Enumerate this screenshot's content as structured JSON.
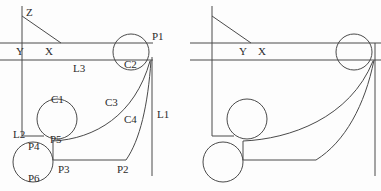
{
  "figure": {
    "title": "",
    "background_color": "#fdfdfd",
    "stroke_color": "#4a4a4a",
    "text_color": "#2b2b2b",
    "panel_count": 2
  },
  "panels": [
    {
      "id": "left-panel",
      "name": "annotated-diagram",
      "labeled": true,
      "labels": [
        {
          "id": "Z",
          "text": "Z",
          "x": 26,
          "y": 12
        },
        {
          "id": "Y",
          "text": "Y",
          "x": 16,
          "y": 51
        },
        {
          "id": "X",
          "text": "X",
          "x": 45,
          "y": 51
        },
        {
          "id": "L3",
          "text": "L3",
          "x": 73,
          "y": 68
        },
        {
          "id": "P1",
          "text": "P1",
          "x": 152,
          "y": 36
        },
        {
          "id": "C2",
          "text": "C2",
          "x": 126,
          "y": 64
        },
        {
          "id": "C1",
          "text": "C1",
          "x": 54,
          "y": 99
        },
        {
          "id": "C3",
          "text": "C3",
          "x": 107,
          "y": 102
        },
        {
          "id": "C4",
          "text": "C4",
          "x": 126,
          "y": 119
        },
        {
          "id": "L1",
          "text": "L1",
          "x": 158,
          "y": 114
        },
        {
          "id": "L2",
          "text": "L2",
          "x": 14,
          "y": 134
        },
        {
          "id": "P5",
          "text": "P5",
          "x": 52,
          "y": 139
        },
        {
          "id": "P4",
          "text": "P4",
          "x": 31,
          "y": 146
        },
        {
          "id": "P3",
          "text": "P3",
          "x": 60,
          "y": 169
        },
        {
          "id": "P2",
          "text": "P2",
          "x": 119,
          "y": 169
        },
        {
          "id": "P6",
          "text": "P6",
          "x": 31,
          "y": 178
        }
      ]
    },
    {
      "id": "right-panel",
      "name": "unannotated-diagram",
      "labeled": false,
      "labels": [
        {
          "id": "Y",
          "text": "Y",
          "x": 239,
          "y": 51
        },
        {
          "id": "X",
          "text": "X",
          "x": 258,
          "y": 51
        }
      ]
    }
  ],
  "geometry": {
    "description": "Cross-section profile with two horizontal rails, a vertical right boundary, two tangent arcs and three tangent circles.",
    "left_origin_x": 0,
    "right_origin_x": 190,
    "elements": {
      "z_axis_label": "Z",
      "line_L1_name": "L1",
      "line_L2_name": "L2",
      "line_L3_name": "L3",
      "circle_C1_name": "C1",
      "circle_C2_name": "C2",
      "curve_C3_name": "C3",
      "curve_C4_name": "C4",
      "point_P1_name": "P1",
      "point_P2_name": "P2",
      "point_P3_name": "P3",
      "point_P4_name": "P4",
      "point_P5_name": "P5",
      "point_P6_name": "P6"
    },
    "circles": [
      {
        "id": "C2",
        "cx": 131,
        "cy": 52,
        "r": 18
      },
      {
        "id": "C1",
        "cx": 57,
        "cy": 119,
        "r": 20
      },
      {
        "id": "C6",
        "cx": 33,
        "cy": 162,
        "r": 20
      }
    ],
    "lines": [
      {
        "id": "z-vertical",
        "x1": 22,
        "y1": 6,
        "x2": 22,
        "y2": 43
      },
      {
        "id": "z-diagonal",
        "x1": 22,
        "y1": 16,
        "x2": 60,
        "y2": 43
      },
      {
        "id": "rail-top",
        "x1": 0,
        "y1": 43,
        "x2": 152,
        "y2": 43
      },
      {
        "id": "rail-bottom",
        "x1": 0,
        "y1": 60,
        "x2": 152,
        "y2": 60
      },
      {
        "id": "left-wall",
        "x1": 22,
        "y1": 43,
        "x2": 22,
        "y2": 136
      },
      {
        "id": "L2-seg",
        "x1": 22,
        "y1": 136,
        "x2": 42,
        "y2": 136
      },
      {
        "id": "L1-vert",
        "x1": 152,
        "y1": 57,
        "x2": 152,
        "y2": 176
      },
      {
        "id": "bottom-seg",
        "x1": 53,
        "y1": 160,
        "x2": 125,
        "y2": 160
      },
      {
        "id": "P5-P3",
        "x1": 53,
        "y1": 141,
        "x2": 53,
        "y2": 160
      }
    ]
  }
}
